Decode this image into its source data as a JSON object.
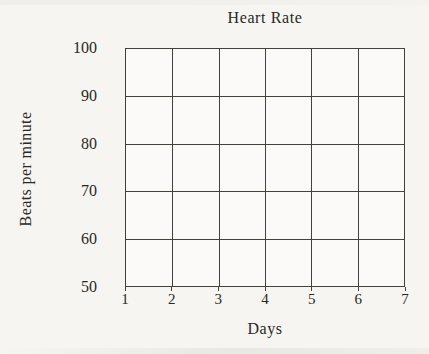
{
  "chart_data": {
    "type": "line",
    "title": "Heart Rate",
    "xlabel": "Days",
    "ylabel": "Beats per minute",
    "x_ticks": [
      1,
      2,
      3,
      4,
      5,
      6,
      7
    ],
    "y_ticks": [
      50,
      60,
      70,
      80,
      90,
      100
    ],
    "xlim": [
      1,
      7
    ],
    "ylim": [
      50,
      100
    ],
    "grid": true,
    "legend": false,
    "series": [],
    "note": "empty grid, no data plotted"
  },
  "colors": {
    "background": "#f6f5f2",
    "plot_background": "#fbfaf8",
    "grid_line": "#44413b",
    "text": "#2a2822"
  }
}
